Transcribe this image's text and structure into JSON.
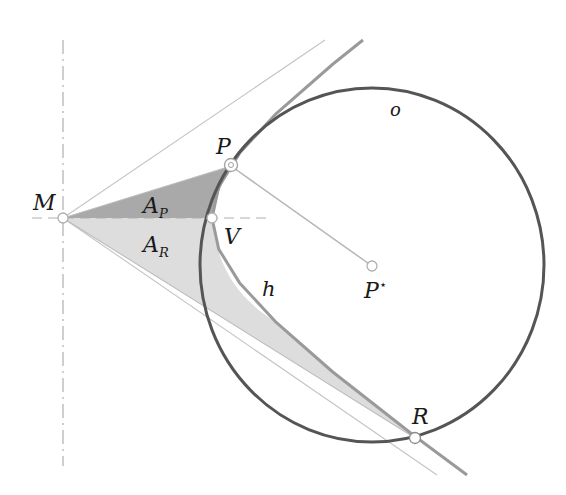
{
  "diagram": {
    "type": "geometry",
    "colors": {
      "circle": "#555555",
      "hyperbola": "#9a9a9a",
      "thin_lines": "#bdbdbd",
      "axis": "#b0b0b0",
      "area_P": "#a9a9a9",
      "area_R": "#dddddd"
    },
    "points": {
      "M": {
        "label": "M",
        "x": 63,
        "y": 218
      },
      "P": {
        "label": "P",
        "x": 231,
        "y": 166
      },
      "V": {
        "label": "V",
        "x": 212,
        "y": 218
      },
      "P_star": {
        "label": "P",
        "sup": "⋆",
        "x": 372,
        "y": 266
      },
      "R": {
        "label": "R",
        "x": 415,
        "y": 438
      }
    },
    "curves": {
      "circle": {
        "label": "o",
        "cx": 372,
        "cy": 265,
        "rx": 172,
        "ry": 177
      },
      "hyperbola": {
        "label": "h",
        "center": "M",
        "a": 149,
        "b": 102
      }
    },
    "areas": {
      "A_P": {
        "label": "A",
        "sub": "P"
      },
      "A_R": {
        "label": "A",
        "sub": "R"
      }
    }
  }
}
